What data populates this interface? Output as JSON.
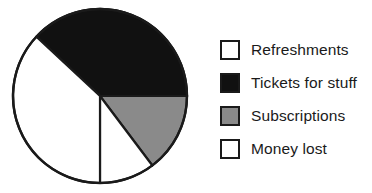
{
  "figure": {
    "kind": "pie-chart-with-legend",
    "background_color": "#ffffff",
    "outline_color": "#1a1a1a"
  },
  "legend": {
    "position": "right",
    "items": [
      {
        "label": "Refreshments",
        "color": "#ffffff",
        "swatch_name": "legend-swatch-refreshments"
      },
      {
        "label": "Tickets for stuff",
        "color": "#111111",
        "swatch_name": "legend-swatch-tickets-for-stuff"
      },
      {
        "label": "Subscriptions",
        "color": "#8a8a8a",
        "swatch_name": "legend-swatch-subscriptions"
      },
      {
        "label": "Money lost",
        "color": "#ffffff",
        "swatch_name": "legend-swatch-money-lost"
      }
    ]
  },
  "chart_data": {
    "type": "pie",
    "title": "",
    "xlabel": "",
    "ylabel": "",
    "grid": false,
    "legend_position": "right",
    "center": {
      "x": 100,
      "y": 96
    },
    "radius": 87,
    "start_angle_deg": 0,
    "direction": "clockwise",
    "labels": [
      "Refreshments",
      "Tickets for stuff",
      "Subscriptions",
      "Money lost"
    ],
    "values": [
      37,
      38,
      15,
      10
    ],
    "colors": [
      "#ffffff",
      "#111111",
      "#8a8a8a",
      "#ffffff"
    ],
    "slices": [
      {
        "label": "Tickets for stuff",
        "color": "#111111",
        "value": 38,
        "start_angle_deg": 313,
        "end_angle_deg": 450,
        "sweep_deg": 137
      },
      {
        "label": "Subscriptions",
        "color": "#8a8a8a",
        "value": 15,
        "start_angle_deg": 90,
        "end_angle_deg": 143,
        "sweep_deg": 53
      },
      {
        "label": "Money lost",
        "color": "#ffffff",
        "value": 10,
        "start_angle_deg": 143,
        "end_angle_deg": 180,
        "sweep_deg": 37
      },
      {
        "label": "Refreshments",
        "color": "#ffffff",
        "value": 37,
        "start_angle_deg": 180,
        "end_angle_deg": 313,
        "sweep_deg": 133
      }
    ]
  }
}
